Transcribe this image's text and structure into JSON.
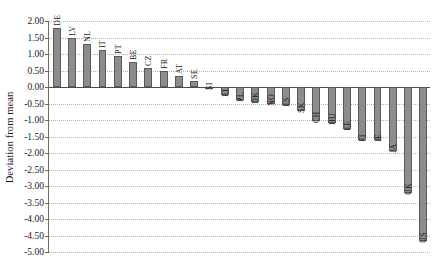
{
  "chart_data": {
    "type": "bar",
    "title": "",
    "xlabel": "",
    "ylabel": "Deviation from mean",
    "ylim": [
      -5.0,
      2.0
    ],
    "ytick_step": 0.5,
    "grid": true,
    "legend": false,
    "orientation": "vertical",
    "bar_color": "#8c8c8c",
    "bar_edge_color": "#595959",
    "categories": [
      "DE",
      "LV",
      "NL",
      "IT",
      "PT",
      "BE",
      "CZ",
      "FR",
      "AT",
      "SE",
      "SI",
      "EL",
      "PL",
      "DK",
      "NO",
      "ES",
      "SK",
      "CH",
      "HU",
      "EE",
      "FI",
      "IE",
      "JA",
      "UK",
      "US"
    ],
    "values": [
      1.8,
      1.5,
      1.29,
      1.11,
      0.94,
      0.76,
      0.58,
      0.48,
      0.34,
      0.19,
      -0.02,
      -0.25,
      -0.38,
      -0.46,
      -0.5,
      -0.55,
      -0.72,
      -1.04,
      -1.1,
      -1.26,
      -1.6,
      -1.62,
      -1.95,
      -3.22,
      -4.68
    ],
    "ytick_labels": [
      "2.00",
      "1.50",
      "1.00",
      "0.50",
      "0.00",
      "-0.50",
      "-1.00",
      "-1.50",
      "-2.00",
      "-2.50",
      "-3.00",
      "-3.50",
      "-4.00",
      "-4.50",
      "-5.00"
    ],
    "ytick_values": [
      2.0,
      1.5,
      1.0,
      0.5,
      0.0,
      -0.5,
      -1.0,
      -1.5,
      -2.0,
      -2.5,
      -3.0,
      -3.5,
      -4.0,
      -4.5,
      -5.0
    ]
  }
}
